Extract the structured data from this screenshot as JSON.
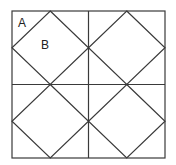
{
  "diagram": {
    "outer_square": {
      "x1": 12,
      "y1": 11,
      "x2": 165,
      "y2": 158
    },
    "grid": {
      "rows": 2,
      "cols": 2
    },
    "labels": [
      {
        "id": "A",
        "text": "A",
        "x": 18,
        "y": 27
      },
      {
        "id": "B",
        "text": "B",
        "x": 41,
        "y": 49
      }
    ],
    "colors": {
      "line": "#3a3a3a",
      "background": "#ffffff"
    }
  }
}
